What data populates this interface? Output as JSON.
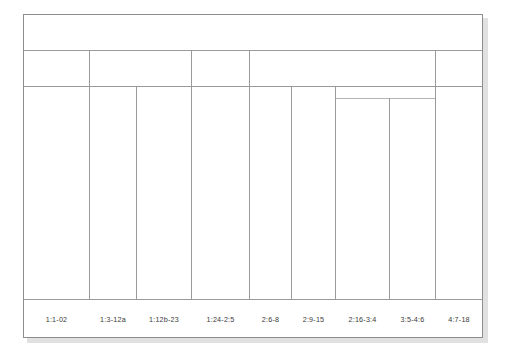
{
  "diagram": {
    "type": "bracket-outline",
    "frame": {
      "stroke_color": "#8d8d8d",
      "background": "#ffffff",
      "shadow_color": "#c9c9c9"
    },
    "rows": {
      "header_band": {
        "name": "top-band",
        "cells": 1
      },
      "second_band": {
        "name": "second-band",
        "cells": 5
      },
      "column_band": {
        "name": "column-band",
        "cells": 9
      },
      "label_band": {
        "name": "label-band",
        "cells": 9
      }
    },
    "segments": [
      {
        "id": "seg-1",
        "label": "1:1-02"
      },
      {
        "id": "seg-2",
        "label": "1:3-12a"
      },
      {
        "id": "seg-3",
        "label": "1:12b-23"
      },
      {
        "id": "seg-4",
        "label": "1:24-2:5"
      },
      {
        "id": "seg-5",
        "label": "2:6-8"
      },
      {
        "id": "seg-6",
        "label": "2:9-15"
      },
      {
        "id": "seg-7",
        "label": "2:16-3:4"
      },
      {
        "id": "seg-8",
        "label": "3:5-4:6"
      },
      {
        "id": "seg-9",
        "label": "4:7-18"
      }
    ],
    "second_band_cells": [
      {
        "id": "band2-a",
        "label": ""
      },
      {
        "id": "band2-b",
        "label": ""
      },
      {
        "id": "band2-c",
        "label": ""
      },
      {
        "id": "band2-d",
        "label": ""
      },
      {
        "id": "band2-e",
        "label": ""
      }
    ],
    "top_band_cell": {
      "id": "band1-a",
      "label": ""
    },
    "nested_group": {
      "id": "nested-subgroup",
      "label": "",
      "spans": [
        "2:16-3:4",
        "3:5-4:6"
      ]
    }
  }
}
